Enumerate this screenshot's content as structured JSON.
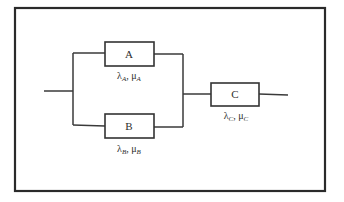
{
  "diagram": {
    "type": "reliability-block-diagram",
    "colors": {
      "line": "#3a3a3a",
      "frame": "#2a2a2a",
      "background": "#ffffff"
    },
    "blocks": [
      {
        "id": "A",
        "label": "A",
        "lambda": "λ",
        "lambda_sub": "A",
        "mu": "μ",
        "mu_sub": "A",
        "sep": ", "
      },
      {
        "id": "B",
        "label": "B",
        "lambda": "λ",
        "lambda_sub": "B",
        "mu": "μ",
        "mu_sub": "B",
        "sep": ", "
      },
      {
        "id": "C",
        "label": "C",
        "lambda": "λ",
        "lambda_sub": "C",
        "mu": "μ",
        "mu_sub": "C",
        "sep": ", "
      }
    ],
    "connections": [
      "input -> parallel(A, B)",
      "parallel(A, B) -> C",
      "C -> output"
    ]
  }
}
